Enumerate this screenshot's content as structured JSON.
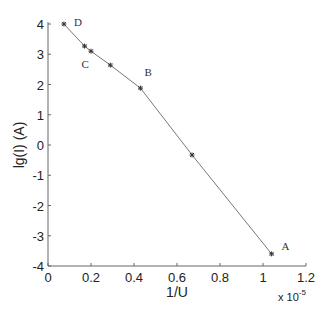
{
  "chart_data": {
    "type": "line",
    "title": "",
    "xlabel": "1/U",
    "ylabel": "lg(I) (A)",
    "x_multiplier": "x 10^-5",
    "x_multiplier_base": "x 10",
    "x_multiplier_exp": "-5",
    "xlim": [
      0,
      1.2
    ],
    "ylim": [
      -4,
      4
    ],
    "xticks": [
      "0",
      "0.2",
      "0.4",
      "0.6",
      "0.8",
      "1",
      "1.2"
    ],
    "yticks": [
      "4",
      "3",
      "2",
      "1",
      "0",
      "-1",
      "-2",
      "-3",
      "-4"
    ],
    "grid": false,
    "legend": null,
    "series": [
      {
        "name": "lg(I) vs 1/U",
        "marker": "*",
        "color": "#555555",
        "x": [
          0.074,
          0.17,
          0.2,
          0.29,
          0.43,
          0.67,
          1.04
        ],
        "y": [
          4.0,
          3.27,
          3.1,
          2.64,
          1.88,
          -0.33,
          -3.6
        ]
      }
    ],
    "annotations": [
      {
        "text": "D",
        "x": 0.074,
        "y": 4.0
      },
      {
        "text": "C",
        "x": 0.17,
        "y": 3.27
      },
      {
        "text": "B",
        "x": 0.43,
        "y": 1.88
      },
      {
        "text": "A",
        "x": 1.04,
        "y": -3.6
      }
    ]
  }
}
